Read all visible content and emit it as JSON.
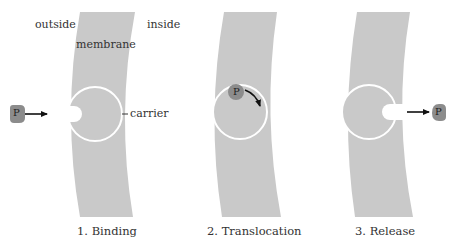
{
  "labels": {
    "outside": "outside",
    "inside": "inside",
    "membrane": "membrane",
    "carrier": "carrier"
  },
  "molecule": {
    "label": "P"
  },
  "steps": [
    {
      "caption": "1. Binding"
    },
    {
      "caption": "2. Translocation"
    },
    {
      "caption": "3. Release"
    }
  ],
  "colors": {
    "membrane": "#c9c9c9",
    "carrier_outline": "#ffffff",
    "molecule": "#8c8c8c",
    "arrow": "#111111",
    "text": "#333333"
  }
}
